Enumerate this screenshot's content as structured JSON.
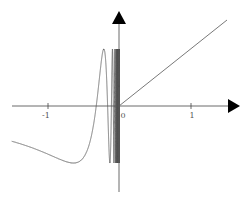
{
  "chart_data": {
    "type": "line",
    "title": "",
    "xlabel": "",
    "ylabel": "",
    "function_description": "piecewise: y = sin(1/x) for x < 0, y = x for x >= 0",
    "xlim": [
      -1.5,
      1.65
    ],
    "ylim": [
      -1.2,
      1.65
    ],
    "grid": false,
    "legend": null,
    "x_ticks": [
      -1,
      0,
      1
    ],
    "x_tick_labels": [
      "-1",
      "0",
      "1"
    ],
    "series": [
      {
        "name": "sin(1/x), x<0",
        "x_range": [
          -1.5,
          0
        ],
        "samples": [
          {
            "x": -1.5,
            "y": -0.62
          },
          {
            "x": -1.0,
            "y": -0.84
          },
          {
            "x": -0.64,
            "y": -1.0
          },
          {
            "x": -0.32,
            "y": 0.0
          },
          {
            "x": -0.21,
            "y": 1.0
          },
          {
            "x": -0.16,
            "y": 0.0
          },
          {
            "x": -0.09,
            "y": -1.0
          },
          {
            "x": -0.06,
            "y": 1.0
          }
        ]
      },
      {
        "name": "x, x>=0",
        "x_range": [
          0,
          1.5
        ],
        "samples": [
          {
            "x": 0,
            "y": 0
          },
          {
            "x": 1.5,
            "y": 1.5
          }
        ]
      }
    ],
    "axes": {
      "arrows": true,
      "color": "#444444"
    },
    "line_color": "#555555"
  },
  "labels": {
    "tick_neg1": "-1",
    "tick_0": "0",
    "tick_1": "1"
  }
}
